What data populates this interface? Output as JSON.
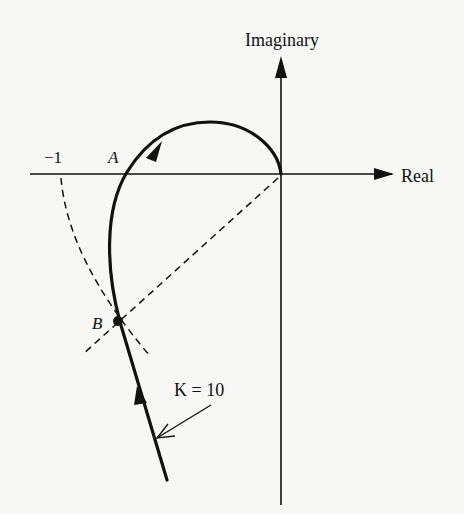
{
  "figure": {
    "type": "nyquist-plot",
    "axes": {
      "real_label": "Real",
      "imag_label": "Imaginary"
    },
    "annotations": {
      "minus_one": "−1",
      "point_a": "A",
      "point_b": "B",
      "gain_label": "K = 10"
    },
    "colors": {
      "ink": "#111111",
      "background": "#f7f7f5"
    }
  }
}
